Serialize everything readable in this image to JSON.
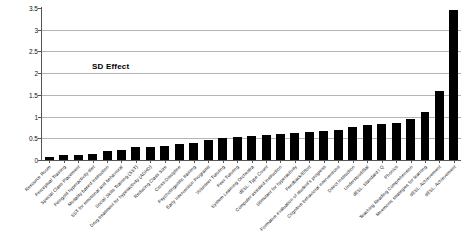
{
  "chart_data": {
    "type": "bar",
    "title": "",
    "xlabel": "",
    "ylabel": "",
    "ylim": [
      0,
      3.5
    ],
    "yticks": [
      0,
      0.5,
      1,
      1.5,
      2,
      2.5,
      3,
      3.5
    ],
    "ytick_labels": [
      "0",
      "0.5",
      "1",
      "1.5",
      "2",
      "2.5",
      "3",
      "3.5"
    ],
    "grid": true,
    "legend_position": "inside-upper-left",
    "annotations": [
      "SD Effect"
    ],
    "series_name": "SD Effect",
    "bar_color": "#000000",
    "categories": [
      "Resource Room",
      "Perceptual Training",
      "Special Class Placement",
      "Feingold hyperactivity diet",
      "Modality based instruction",
      "SST for emotional and behavioral",
      "Social Skills Training (SST)",
      "Drug treatment for hyperactivity (ADHD)",
      "Reducing Class Size",
      "Cross-Discipline",
      "Psycholinguistic training",
      "Early Intervention Programs",
      "Volunteer Tutoring",
      "Peer Tutoring",
      "System Learning Orchestra",
      "dESL: Type Count",
      "Computer assisted instruction",
      "Stimulant for hyperactivity",
      "Feedback/Effort",
      "Formative evaluation of student's progress",
      "Cognitive behavioral interventions",
      "Direct Instruction",
      "Understood/Bal",
      "dESL: Standard I Q",
      "Phonics",
      "Teaching Reading Comprehension",
      "Mnemonic strategies for learning",
      "dESL: Achievement"
    ],
    "values": [
      0.07,
      0.11,
      0.11,
      0.13,
      0.2,
      0.22,
      0.3,
      0.3,
      0.33,
      0.38,
      0.4,
      0.46,
      0.5,
      0.52,
      0.55,
      0.58,
      0.6,
      0.62,
      0.65,
      0.67,
      0.7,
      0.75,
      0.8,
      0.82,
      0.86,
      0.95,
      1.1,
      1.6
    ],
    "extra_values": [
      3.45
    ],
    "extra_categories": [
      "dESL: Achievement"
    ]
  }
}
